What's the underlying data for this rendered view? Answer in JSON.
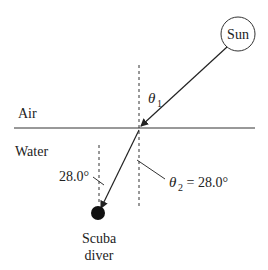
{
  "diagram": {
    "sun_label": "Sun",
    "air_label": "Air",
    "water_label": "Water",
    "theta1_symbol": "θ",
    "theta1_sub": "1",
    "theta2_symbol": "θ",
    "theta2_sub": "2",
    "theta2_value": " = 28.0°",
    "diver_angle_label": "28.0°",
    "diver_label_line1": "Scuba",
    "diver_label_line2": "diver"
  }
}
